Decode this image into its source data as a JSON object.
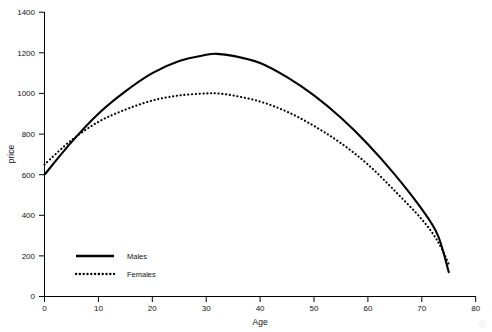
{
  "chart_data": {
    "type": "line",
    "title": "",
    "xlabel": "Age",
    "ylabel": "price",
    "xlim": [
      0,
      80
    ],
    "ylim": [
      0,
      1400
    ],
    "grid": false,
    "legend_position": "bottom-left",
    "xticks": [
      "0",
      "10",
      "20",
      "30",
      "40",
      "50",
      "60",
      "70",
      "80"
    ],
    "yticks": [
      "0",
      "200",
      "400",
      "600",
      "800",
      "1000",
      "1200",
      "1400"
    ],
    "x": [
      0,
      5,
      10,
      15,
      20,
      25,
      30,
      32,
      35,
      40,
      45,
      50,
      55,
      60,
      65,
      70,
      73,
      75
    ],
    "series": [
      {
        "name": "Males",
        "style": "solid",
        "values": [
          600,
          760,
          900,
          1010,
          1100,
          1160,
          1190,
          1195,
          1185,
          1150,
          1080,
          990,
          880,
          750,
          600,
          430,
          300,
          120
        ]
      },
      {
        "name": "Females",
        "style": "dotted",
        "values": [
          650,
          770,
          860,
          920,
          965,
          990,
          1000,
          1000,
          990,
          960,
          910,
          840,
          755,
          650,
          520,
          380,
          270,
          160
        ]
      }
    ]
  },
  "legend": {
    "items": [
      {
        "label": "Males",
        "style": "solid"
      },
      {
        "label": "Females",
        "style": "dotted"
      }
    ]
  },
  "watermark": "ⓒ"
}
